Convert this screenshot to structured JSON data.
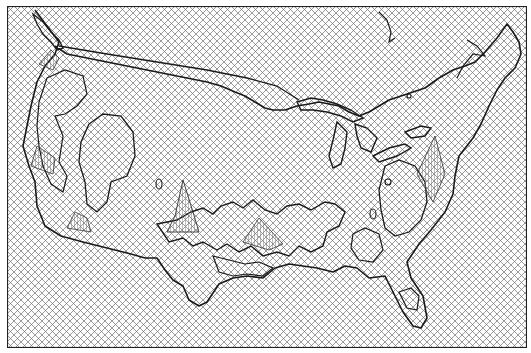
{
  "map": {
    "title": "",
    "region": "Contiguous United States",
    "style": "wireframe surface / crosshatch mesh",
    "colors": {
      "background": "#ffffff",
      "mesh": "#6a6a6a",
      "outline": "#1a1a1a",
      "frame": "#222222"
    },
    "features": [
      "country-outline",
      "great-lakes",
      "florida-peninsula",
      "us-canada-border",
      "surface-peaks",
      "contour-regions"
    ]
  }
}
